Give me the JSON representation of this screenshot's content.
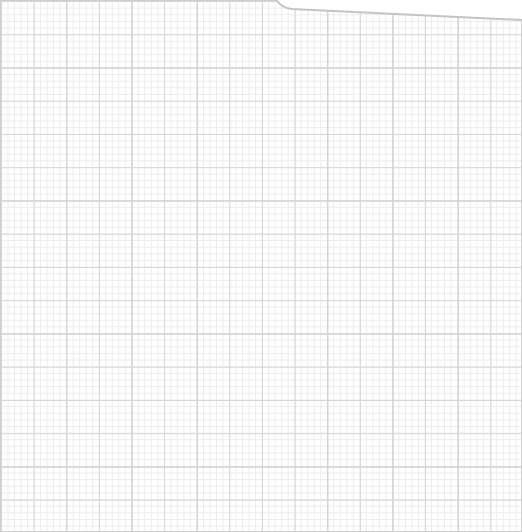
{
  "page": {
    "type": "graph-paper",
    "grid": {
      "major_spacing_px": 32.6,
      "minor_divisions": 5,
      "major_color": "#c8c8c8",
      "minor_color": "#ececec"
    },
    "top_edge": "torn-curve-right"
  }
}
